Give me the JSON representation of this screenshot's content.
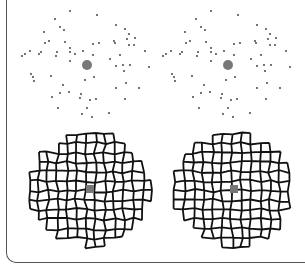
{
  "figure": {
    "colors": {
      "dots": "#333333",
      "center": "#777777",
      "mosaic_stroke": "#111111",
      "frame": "#555555"
    },
    "panels": [
      {
        "id": "top-left",
        "type": "point-pattern",
        "center": [
          87,
          65
        ]
      },
      {
        "id": "top-right",
        "type": "point-pattern",
        "center": [
          228,
          65
        ]
      },
      {
        "id": "bottom-left",
        "type": "cell-mosaic",
        "center": [
          90,
          189
        ]
      },
      {
        "id": "bottom-right",
        "type": "cell-mosaic",
        "center": [
          234,
          189
        ]
      }
    ]
  }
}
